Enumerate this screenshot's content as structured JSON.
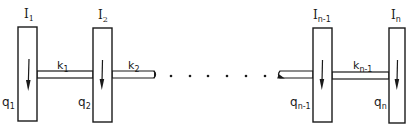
{
  "diagram": {
    "disks": [
      {
        "inertia_base": "I",
        "inertia_sub": "1",
        "coord_base": "q",
        "coord_sub": "1"
      },
      {
        "inertia_base": "I",
        "inertia_sub": "2",
        "coord_base": "q",
        "coord_sub": "2"
      },
      {
        "inertia_base": "I",
        "inertia_sub": "n-1",
        "coord_base": "q",
        "coord_sub": "n-1"
      },
      {
        "inertia_base": "I",
        "inertia_sub": "n",
        "coord_base": "q",
        "coord_sub": "n"
      }
    ],
    "shafts": [
      {
        "stiffness_base": "k",
        "stiffness_sub": "1"
      },
      {
        "stiffness_base": "k",
        "stiffness_sub": "2"
      },
      {
        "stiffness_base": "k",
        "stiffness_sub": "n-1"
      }
    ],
    "ellipsis_dot_count": 6,
    "colors": {
      "stroke": "#1a1a1a",
      "fill": "#ffffff"
    }
  }
}
